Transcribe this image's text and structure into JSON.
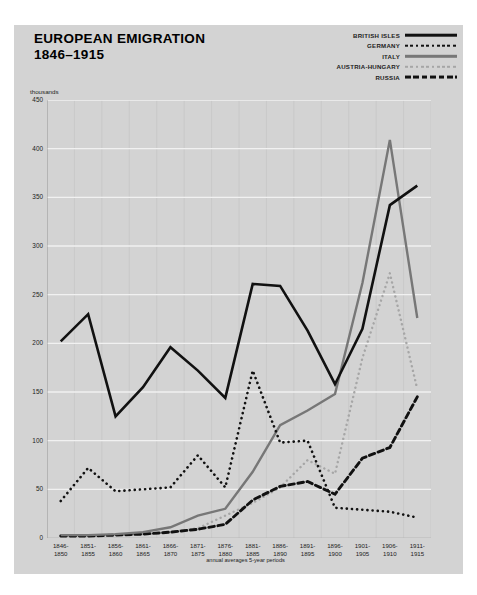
{
  "title": {
    "line1": "EUROPEAN EMIGRATION",
    "line2": "1846–1915"
  },
  "units_label": "thousands",
  "x_caption": "annual averages 5-year periods",
  "legend": {
    "items": [
      {
        "label": "BRITISH ISLES",
        "style": "solid-black",
        "color": "#111111"
      },
      {
        "label": "GERMANY",
        "style": "dot-black",
        "color": "#111111"
      },
      {
        "label": "ITALY",
        "style": "solid-gray",
        "color": "#777777"
      },
      {
        "label": "AUSTRIA-HUNGARY",
        "style": "dot-gray",
        "color": "#a6a6a6"
      },
      {
        "label": "RUSSIA",
        "style": "dash-black",
        "color": "#111111"
      }
    ]
  },
  "chart_data": {
    "type": "line",
    "subtitle": "",
    "xlabel": "annual averages 5-year periods",
    "ylabel": "thousands",
    "ylim": [
      0,
      450
    ],
    "yticks": [
      0,
      50,
      100,
      150,
      200,
      250,
      300,
      350,
      400,
      450
    ],
    "ytick_labels": [
      "0",
      "50",
      "100",
      "150",
      "200",
      "250",
      "300",
      "350",
      "400",
      "450"
    ],
    "grid": true,
    "legend_position": "top-right",
    "categories": [
      "1846-1850",
      "1851-1855",
      "1856-1860",
      "1861-1865",
      "1866-1870",
      "1871-1875",
      "1876-1880",
      "1881-1885",
      "1886-1890",
      "1891-1895",
      "1896-1900",
      "1901-1905",
      "1906-1910",
      "1911-1915"
    ],
    "category_lines": [
      [
        "1846-",
        "1850"
      ],
      [
        "1851-",
        "1855"
      ],
      [
        "1856-",
        "1860"
      ],
      [
        "1861-",
        "1865"
      ],
      [
        "1866-",
        "1870"
      ],
      [
        "1871-",
        "1875"
      ],
      [
        "1876-",
        "1880"
      ],
      [
        "1881-",
        "1885"
      ],
      [
        "1886-",
        "1890"
      ],
      [
        "1891-",
        "1895"
      ],
      [
        "1896-",
        "1900"
      ],
      [
        "1901-",
        "1905"
      ],
      [
        "1906-",
        "1910"
      ],
      [
        "1911-",
        "1915"
      ]
    ],
    "series": [
      {
        "name": "BRITISH ISLES",
        "color": "#111111",
        "style": "solid",
        "width": 2.6,
        "values": [
          202,
          230,
          125,
          155,
          196,
          172,
          144,
          261,
          259,
          213,
          158,
          215,
          342,
          362
        ]
      },
      {
        "name": "GERMANY",
        "color": "#111111",
        "style": "dotted",
        "width": 2.6,
        "values": [
          38,
          72,
          48,
          50,
          52,
          85,
          52,
          172,
          98,
          100,
          31,
          29,
          27,
          21
        ]
      },
      {
        "name": "ITALY",
        "color": "#777777",
        "style": "solid",
        "width": 2.4,
        "values": [
          3,
          3,
          4,
          6,
          11,
          23,
          30,
          68,
          116,
          131,
          148,
          262,
          409,
          226
        ]
      },
      {
        "name": "AUSTRIA-HUNGARY",
        "color": "#a6a6a6",
        "style": "dotted",
        "width": 2.4,
        "values": [
          2,
          2,
          3,
          4,
          6,
          10,
          23,
          36,
          52,
          80,
          66,
          185,
          272,
          153
        ]
      },
      {
        "name": "RUSSIA",
        "color": "#111111",
        "style": "dashed",
        "width": 2.9,
        "values": [
          2,
          2,
          3,
          4,
          6,
          9,
          14,
          39,
          53,
          58,
          45,
          82,
          93,
          145
        ]
      }
    ]
  }
}
